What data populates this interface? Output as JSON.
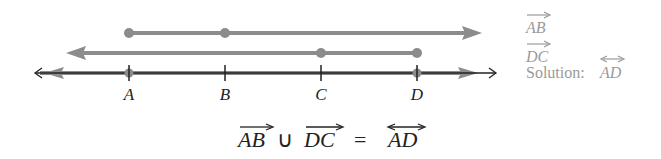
{
  "figure": {
    "points": [
      {
        "label": "A",
        "x": 129
      },
      {
        "label": "B",
        "x": 225
      },
      {
        "label": "C",
        "x": 321
      },
      {
        "label": "D",
        "x": 417
      }
    ],
    "rays": [
      {
        "name": "ray-AB",
        "label": "AB",
        "from": "A",
        "direction": "right",
        "marked_points": [
          "A",
          "B"
        ]
      },
      {
        "name": "ray-DC",
        "label": "DC",
        "from": "D",
        "direction": "left",
        "marked_points": [
          "D",
          "C"
        ]
      }
    ],
    "solution_line": {
      "label": "AD",
      "type": "line"
    },
    "colors": {
      "ray": "#8c8c8c",
      "line": "#222222",
      "legend": "#9a9a9a"
    }
  },
  "legend": {
    "ray_ab": "AB",
    "ray_dc": "DC",
    "solution_prefix": "Solution:",
    "solution_line": "AD"
  },
  "equation": {
    "term1": "AB",
    "union": "∪",
    "term2": "DC",
    "equals": "=",
    "result": "AD"
  }
}
